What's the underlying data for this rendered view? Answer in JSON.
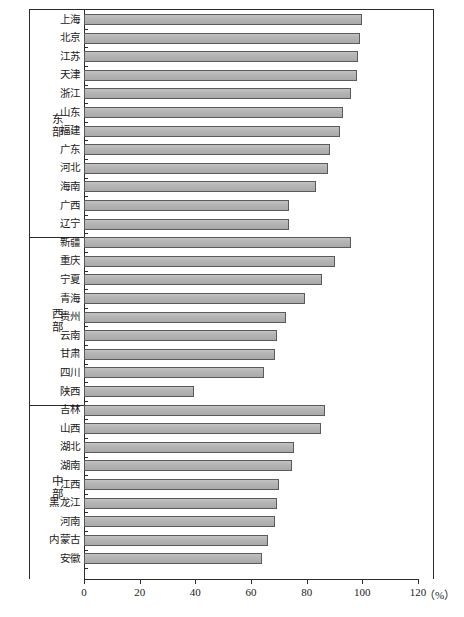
{
  "chart_data": {
    "type": "bar",
    "orientation": "horizontal",
    "title": "",
    "subtitle": "",
    "xlabel": "",
    "ylabel": "",
    "unit_label": "（%）",
    "xlim": [
      0,
      120
    ],
    "xticks": [
      0,
      20,
      40,
      60,
      80,
      100,
      120
    ],
    "xtick_labels": [
      "0",
      "20",
      "40",
      "60",
      "80",
      "100",
      "120"
    ],
    "grid": false,
    "legend": null,
    "groups": [
      {
        "name": "东部",
        "categories": [
          "上海",
          "北京",
          "江苏",
          "天津",
          "浙江",
          "山东",
          "福建",
          "广东",
          "河北",
          "海南",
          "广西",
          "辽宁"
        ],
        "values": [
          100.0,
          99.2,
          98.5,
          98.0,
          96.0,
          93.2,
          92.0,
          88.5,
          87.8,
          83.5,
          73.8,
          73.5
        ]
      },
      {
        "name": "西部",
        "categories": [
          "新疆",
          "重庆",
          "宁夏",
          "青海",
          "贵州",
          "云南",
          "甘肃",
          "四川",
          "陕西"
        ],
        "values": [
          96.0,
          90.0,
          85.5,
          79.5,
          72.5,
          69.5,
          68.5,
          64.5,
          39.5
        ]
      },
      {
        "name": "中部",
        "categories": [
          "吉林",
          "山西",
          "湖北",
          "湖南",
          "江西",
          "黑龙江",
          "河南",
          "内蒙古",
          "安徽"
        ],
        "values": [
          86.5,
          85.0,
          75.5,
          74.8,
          70.0,
          69.5,
          68.5,
          66.0,
          64.0
        ]
      }
    ],
    "colors": {
      "bar_fill": "#b3b3b3",
      "bar_border": "#5a5a5a",
      "axis": "#2b2b2b",
      "text": "#1a1a1a",
      "background": "#ffffff"
    }
  }
}
